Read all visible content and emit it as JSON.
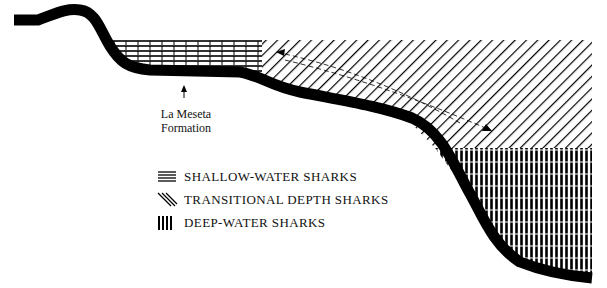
{
  "diagram": {
    "type": "cross-section",
    "annotation": {
      "line1": "La Meseta",
      "line2": "Formation"
    },
    "legend": [
      {
        "pattern": "horizontal-hatch",
        "label": "SHALLOW-WATER SHARKS"
      },
      {
        "pattern": "diagonal-hatch",
        "label": "TRANSITIONAL DEPTH SHARKS"
      },
      {
        "pattern": "vertical-hatch",
        "label": "DEEP-WATER SHARKS"
      }
    ],
    "colors": {
      "ink": "#000000",
      "background": "#ffffff"
    }
  }
}
